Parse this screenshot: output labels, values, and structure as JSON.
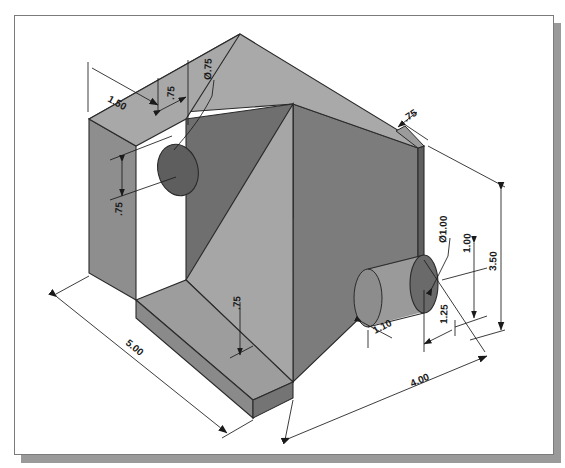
{
  "drawing": {
    "title": "Isometric dimensioned solid model",
    "type": "isometric-technical-drawing",
    "units": "inches",
    "sheet": {
      "background_color": "#ffffff",
      "border_color": "#7b7b7b",
      "shadow_color": "#9a9a9a"
    },
    "model": {
      "description": "Angle block with inclined ramp, through hole in left wall and cylindrical boss on right face",
      "face_colors": {
        "top": "#a3a3a3",
        "front_left": "#8e8e8e",
        "inner_left_wall": "#6f6f6f",
        "ramp": "#a8a8a8",
        "right_side": "#7c7c7c",
        "right_end": "#6a6a6a",
        "cylinder_body": "#9b9b9b",
        "cylinder_end": "#6d6d6d",
        "edge": "#2a2a2a"
      }
    },
    "dimensions": [
      {
        "id": "dim-1-50",
        "label": "1.50",
        "feature": "left wall thickness / offset from back edge",
        "orientation": "iso-top-left"
      },
      {
        "id": "dim-075-a",
        "label": ".75",
        "feature": "hole center offset along top",
        "orientation": "iso-top-left"
      },
      {
        "id": "dim-dia-075",
        "label": "Ø.75",
        "feature": "through hole diameter in left wall",
        "orientation": "leader-note"
      },
      {
        "id": "dim-075-b",
        "label": ".75",
        "feature": "hole center height from top of left wall",
        "orientation": "vertical-left"
      },
      {
        "id": "dim-075-c",
        "label": ".75",
        "feature": "base plate thickness",
        "orientation": "vertical-center"
      },
      {
        "id": "dim-075-d",
        "label": ".75",
        "feature": "rear wall thickness at top right",
        "orientation": "iso-top-right"
      },
      {
        "id": "dim-5-00",
        "label": "5.00",
        "feature": "overall length",
        "orientation": "iso-bottom-left"
      },
      {
        "id": "dim-4-00",
        "label": "4.00",
        "feature": "overall depth",
        "orientation": "iso-bottom-right"
      },
      {
        "id": "dim-3-50",
        "label": "3.50",
        "feature": "overall height",
        "orientation": "vertical-far-right"
      },
      {
        "id": "dim-dia-1-00",
        "label": "Ø1.00",
        "feature": "cylindrical boss diameter",
        "orientation": "leader-note"
      },
      {
        "id": "dim-1-00",
        "label": "1.00",
        "feature": "boss center height from base",
        "orientation": "vertical-right"
      },
      {
        "id": "dim-1-10",
        "label": "1.10",
        "feature": "boss projection length",
        "orientation": "iso-bottom-right"
      },
      {
        "id": "dim-1-25",
        "label": "1.25",
        "feature": "boss center offset from right end",
        "orientation": "iso-bottom-right"
      }
    ]
  }
}
